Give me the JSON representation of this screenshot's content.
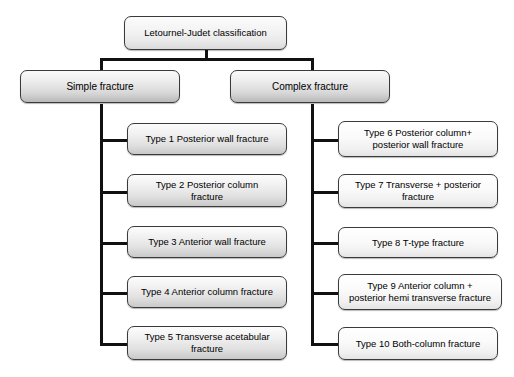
{
  "diagram": {
    "type": "tree-flowchart",
    "background_color": "#ffffff",
    "line_color": "#111111",
    "node_border_color": "#3a3a3a",
    "root": {
      "label": "Letournel-Judet classification"
    },
    "branches": [
      {
        "key": "simple",
        "label": "Simple fracture",
        "children": [
          {
            "label": "Type 1 Posterior wall fracture"
          },
          {
            "label": "Type 2 Posterior column\nfracture"
          },
          {
            "label": "Type 3 Anterior wall fracture"
          },
          {
            "label": "Type 4 Anterior column fracture"
          },
          {
            "label": "Type 5 Transverse acetabular\nfracture"
          }
        ]
      },
      {
        "key": "complex",
        "label": "Complex fracture",
        "children": [
          {
            "label": "Type 6 Posterior column+\nposterior wall fracture"
          },
          {
            "label": "Type 7 Transverse + posterior\nfracture"
          },
          {
            "label": "Type 8 T-type fracture"
          },
          {
            "label": "Type 9 Anterior column +\nposterior hemi transverse fracture"
          },
          {
            "label": "Type 10 Both-column fracture"
          }
        ]
      }
    ]
  }
}
